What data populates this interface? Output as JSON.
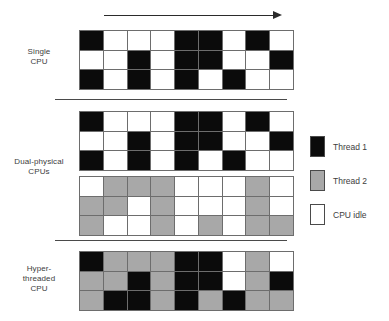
{
  "figure": {
    "time_arrow": {
      "icon": "arrow-right-icon",
      "label": ""
    },
    "colors": {
      "thread1": "#0b0b0b",
      "thread2": "#a8a8a8",
      "idle": "#ffffff",
      "gridline": "#6d6d6d",
      "text": "#3d3d3d"
    }
  },
  "rows": [
    {
      "id": "single-cpu",
      "label_lines": [
        "Single",
        "CPU"
      ],
      "grids": [
        {
          "id": "single-cpu-grid",
          "columns": 9,
          "rows": 3,
          "cells": [
            [
              "black",
              "white",
              "white",
              "white",
              "black",
              "black",
              "white",
              "black",
              "white"
            ],
            [
              "white",
              "white",
              "black",
              "white",
              "black",
              "black",
              "white",
              "white",
              "black"
            ],
            [
              "black",
              "white",
              "black",
              "white",
              "black",
              "white",
              "black",
              "white",
              "white"
            ]
          ]
        }
      ]
    },
    {
      "id": "dual-physical-cpus",
      "label_lines": [
        "Dual-physical",
        "CPUs"
      ],
      "grids": [
        {
          "id": "dual-cpu-grid-thread1",
          "columns": 9,
          "rows": 3,
          "cells": [
            [
              "black",
              "white",
              "white",
              "white",
              "black",
              "black",
              "white",
              "black",
              "white"
            ],
            [
              "white",
              "white",
              "black",
              "white",
              "black",
              "black",
              "white",
              "white",
              "black"
            ],
            [
              "black",
              "white",
              "black",
              "white",
              "black",
              "white",
              "black",
              "white",
              "white"
            ]
          ]
        },
        {
          "id": "dual-cpu-grid-thread2",
          "columns": 9,
          "rows": 3,
          "cells": [
            [
              "white",
              "gray",
              "gray",
              "gray",
              "white",
              "white",
              "white",
              "gray",
              "white"
            ],
            [
              "gray",
              "gray",
              "white",
              "gray",
              "white",
              "white",
              "white",
              "gray",
              "white"
            ],
            [
              "gray",
              "white",
              "white",
              "gray",
              "white",
              "gray",
              "white",
              "gray",
              "gray"
            ]
          ]
        }
      ]
    },
    {
      "id": "hyper-threaded-cpu",
      "label_lines": [
        "Hyper-",
        "threaded",
        "CPU"
      ],
      "grids": [
        {
          "id": "hyper-threaded-grid",
          "columns": 9,
          "rows": 3,
          "cells": [
            [
              "black",
              "gray",
              "gray",
              "gray",
              "black",
              "black",
              "white",
              "gray",
              "white"
            ],
            [
              "gray",
              "gray",
              "black",
              "gray",
              "black",
              "black",
              "white",
              "gray",
              "black"
            ],
            [
              "gray",
              "black",
              "black",
              "gray",
              "black",
              "gray",
              "black",
              "gray",
              "gray"
            ]
          ]
        }
      ]
    }
  ],
  "legend": {
    "items": [
      {
        "swatch": "black",
        "label": "Thread 1"
      },
      {
        "swatch": "gray",
        "label": "Thread 2"
      },
      {
        "swatch": "white",
        "label": "CPU idle"
      }
    ]
  }
}
